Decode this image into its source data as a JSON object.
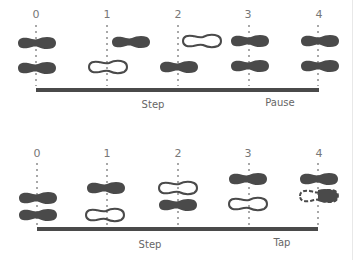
{
  "colors": {
    "foot": "#4a4a4a",
    "bar": "#4a4a4a",
    "guide": "#a8a8a8",
    "text": "#6e6e6e"
  },
  "diagram_top": {
    "counts": [
      "0",
      "1",
      "2",
      "3",
      "4"
    ],
    "count_x": [
      36,
      108,
      178,
      248,
      320
    ],
    "labels": {
      "step": "Step",
      "pause": "Pause"
    },
    "feet": [
      {
        "count": "0",
        "position": "upper",
        "style": "filled"
      },
      {
        "count": "0",
        "position": "lower",
        "style": "filled"
      },
      {
        "count": "1",
        "position": "upper",
        "style": "filled"
      },
      {
        "count": "1",
        "position": "lower",
        "style": "outline"
      },
      {
        "count": "2",
        "position": "upper",
        "style": "outline"
      },
      {
        "count": "2",
        "position": "lower",
        "style": "filled"
      },
      {
        "count": "3",
        "position": "upper",
        "style": "filled"
      },
      {
        "count": "3",
        "position": "lower",
        "style": "filled"
      },
      {
        "count": "4",
        "position": "upper",
        "style": "filled"
      },
      {
        "count": "4",
        "position": "lower",
        "style": "filled"
      }
    ]
  },
  "diagram_bottom": {
    "counts": [
      "0",
      "1",
      "2",
      "3",
      "4"
    ],
    "count_x": [
      36,
      108,
      178,
      248,
      320
    ],
    "labels": {
      "step": "Step",
      "tap": "Tap"
    },
    "feet": [
      {
        "count": "0",
        "position": "upper",
        "style": "filled"
      },
      {
        "count": "0",
        "position": "lower",
        "style": "filled"
      },
      {
        "count": "1",
        "position": "upper",
        "style": "filled"
      },
      {
        "count": "1",
        "position": "lower",
        "style": "outline"
      },
      {
        "count": "2",
        "position": "upper",
        "style": "outline"
      },
      {
        "count": "2",
        "position": "lower",
        "style": "filled"
      },
      {
        "count": "3",
        "position": "upper",
        "style": "filled"
      },
      {
        "count": "3",
        "position": "lower",
        "style": "outline"
      },
      {
        "count": "4",
        "position": "upper",
        "style": "filled"
      },
      {
        "count": "4",
        "position": "lower",
        "style": "dashed-toe-tap"
      }
    ]
  }
}
